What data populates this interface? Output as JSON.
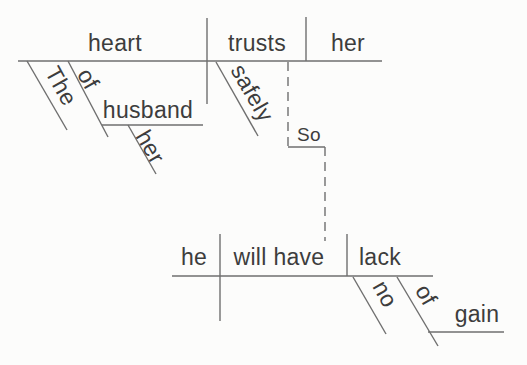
{
  "colors": {
    "background": "#fcfcfb",
    "line": "#6f6f6f",
    "text": "#3d3d3d"
  },
  "clause1": {
    "subject": "heart",
    "verb": "trusts",
    "object": "her",
    "article": "The",
    "preposition": "of",
    "preposition_object": "husband",
    "possessive": "her",
    "adverb": "safely"
  },
  "connector": {
    "conjunction": "So"
  },
  "clause2": {
    "subject": "he",
    "verb": "will have",
    "object": "lack",
    "determiner": "no",
    "preposition": "of",
    "preposition_object": "gain"
  }
}
